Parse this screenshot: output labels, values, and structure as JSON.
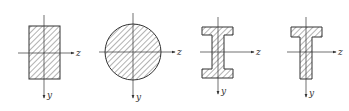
{
  "figure": {
    "colors": {
      "stroke": "#333333",
      "hatch": "#555555",
      "background": "#ffffff"
    },
    "sections": [
      {
        "name": "rectangle",
        "axis_labels": {
          "horizontal": "z",
          "vertical": "y"
        }
      },
      {
        "name": "circle",
        "axis_labels": {
          "horizontal": "z",
          "vertical": "y"
        }
      },
      {
        "name": "i-beam",
        "axis_labels": {
          "horizontal": "z",
          "vertical": "y"
        }
      },
      {
        "name": "t-beam",
        "axis_labels": {
          "horizontal": "z",
          "vertical": "y"
        }
      }
    ]
  }
}
